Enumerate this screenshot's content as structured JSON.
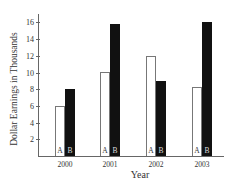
{
  "chart_data": {
    "type": "bar",
    "title": "",
    "xlabel": "Year",
    "ylabel": "Dollar Earnings in Thousands",
    "categories": [
      "2000",
      "2001",
      "2002",
      "2003"
    ],
    "series": [
      {
        "name": "A",
        "values": [
          6,
          10,
          12,
          8.25
        ],
        "color": "#ffffff"
      },
      {
        "name": "B",
        "values": [
          8,
          15.75,
          9,
          16
        ],
        "color": "#111111"
      }
    ],
    "ylim": [
      0,
      17
    ],
    "yticks": [
      2,
      4,
      6,
      8,
      10,
      12,
      14,
      16
    ],
    "grid": false,
    "legend": "none (bars labeled A and B at base)"
  },
  "labels": {
    "bar_a": "A",
    "bar_b": "B"
  }
}
